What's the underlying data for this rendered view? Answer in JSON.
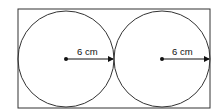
{
  "diagram": {
    "rectangle": {
      "x": 18,
      "y": 9,
      "width": 192,
      "height": 99
    },
    "circles": [
      {
        "name": "left-circle",
        "cx": 66,
        "cy": 59,
        "r": 48,
        "radius_label": "6 cm"
      },
      {
        "name": "right-circle",
        "cx": 162,
        "cy": 59,
        "r": 48,
        "radius_label": "6 cm"
      }
    ],
    "colors": {
      "stroke": "#333333",
      "fill": "#ffffff",
      "text": "#111111"
    }
  }
}
